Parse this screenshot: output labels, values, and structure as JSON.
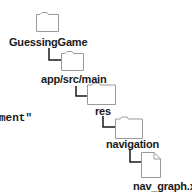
{
  "diagram": {
    "type": "directory-tree",
    "nodes": [
      {
        "kind": "folder",
        "label": "GuessingGame"
      },
      {
        "kind": "folder",
        "label": "app/src/main"
      },
      {
        "kind": "folder",
        "label": "res"
      },
      {
        "kind": "folder",
        "label": "navigation"
      },
      {
        "kind": "file",
        "label": "nav_graph.xml"
      }
    ],
    "edges": [
      {
        "from": "GuessingGame",
        "to": "app/src/main"
      },
      {
        "from": "app/src/main",
        "to": "res"
      },
      {
        "from": "res",
        "to": "navigation"
      },
      {
        "from": "navigation",
        "to": "nav_graph.xml"
      }
    ],
    "colors": {
      "icon_stroke": "#9a9a9a",
      "connector": "#1a1a1a",
      "text": "#1a1a1a",
      "background": "#ffffff"
    }
  },
  "code_fragment": {
    "text": "ment\""
  }
}
